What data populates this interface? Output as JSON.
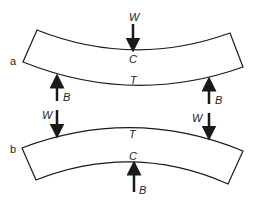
{
  "diagram": {
    "panels": [
      {
        "id": "a",
        "label": "a",
        "description": "Beam supported at ends, loaded in middle (sagging)",
        "load": {
          "label": "W"
        },
        "supports": [
          {
            "label": "B"
          },
          {
            "label": "B"
          }
        ],
        "compression_label": "C",
        "tension_label": "T"
      },
      {
        "id": "b",
        "label": "b",
        "description": "Beam supported in middle, loaded at ends (hogging)",
        "loads": [
          {
            "label": "W"
          },
          {
            "label": "W"
          }
        ],
        "support": {
          "label": "B"
        },
        "tension_label": "T",
        "compression_label": "C"
      }
    ],
    "colors": {
      "stroke": "#1a1a1a",
      "text": "#222222",
      "background": "#ffffff"
    }
  }
}
